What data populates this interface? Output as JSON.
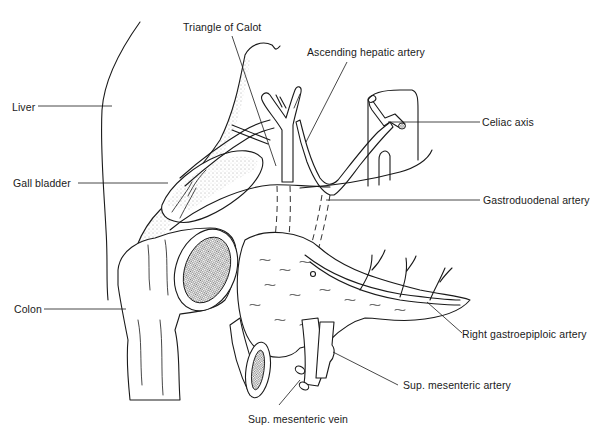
{
  "figure": {
    "type": "anatomical line illustration"
  },
  "labels": {
    "triangle_of_calot": "Triangle of Calot",
    "ascending_hepatic_artery": "Ascending hepatic artery",
    "liver": "Liver",
    "celiac_axis": "Celiac axis",
    "gall_bladder": "Gall bladder",
    "gastroduodenal_artery": "Gastroduodenal artery",
    "colon": "Colon",
    "right_gastroepiploic_artery": "Right gastroepiploic artery",
    "sup_mesenteric_artery": "Sup. mesenteric artery",
    "sup_mesenteric_vein": "Sup. mesenteric vein"
  },
  "colors": {
    "ink": "#1a1a1a",
    "background": "#ffffff"
  }
}
